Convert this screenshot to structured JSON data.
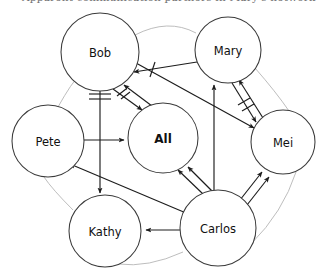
{
  "figure": {
    "type": "node-link-graph",
    "title_fragment": "Apparent communication partners in Mary's network",
    "background_color": "#ffffff",
    "node_fill": "#ffffff",
    "node_stroke": "#3b3b3b",
    "edge_color": "#1c1c1c",
    "ring_color": "#b9b9b9",
    "width": 328,
    "height": 278
  },
  "nodes": [
    {
      "id": "bob",
      "label": "Bob",
      "cx": 100,
      "cy": 52,
      "r": 39,
      "bold": false
    },
    {
      "id": "mary",
      "label": "Mary",
      "cx": 228,
      "cy": 50,
      "r": 33,
      "bold": false
    },
    {
      "id": "pete",
      "label": "Pete",
      "cx": 48,
      "cy": 141,
      "r": 36,
      "bold": false
    },
    {
      "id": "all",
      "label": "All",
      "cx": 163,
      "cy": 138,
      "r": 35,
      "bold": true
    },
    {
      "id": "mei",
      "label": "Mei",
      "cx": 283,
      "cy": 142,
      "r": 32,
      "bold": false
    },
    {
      "id": "kathy",
      "label": "Kathy",
      "cx": 105,
      "cy": 231,
      "r": 36,
      "bold": false
    },
    {
      "id": "carlos",
      "label": "Carlos",
      "cx": 218,
      "cy": 228,
      "r": 38,
      "bold": false
    }
  ],
  "edges": [
    {
      "id": "bob-all-out",
      "from": "bob",
      "to": "all",
      "directed": true,
      "ticks": 2,
      "tick_style": "slash"
    },
    {
      "id": "all-bob-in",
      "from": "all",
      "to": "bob",
      "directed": true,
      "ticks": 0,
      "tick_style": "none"
    },
    {
      "id": "bob-kathy",
      "from": "bob",
      "to": "kathy",
      "directed": true,
      "ticks": 2,
      "tick_style": "bar"
    },
    {
      "id": "pete-all",
      "from": "pete",
      "to": "all",
      "directed": true,
      "ticks": 0,
      "tick_style": "none"
    },
    {
      "id": "bob-mei",
      "from": "bob",
      "to": "mei",
      "directed": true,
      "ticks": 1,
      "tick_style": "slash"
    },
    {
      "id": "mary-bob",
      "from": "mary",
      "to": "bob",
      "directed": true,
      "ticks": 0,
      "tick_style": "none"
    },
    {
      "id": "mary-mei-out",
      "from": "mary",
      "to": "mei",
      "directed": true,
      "ticks": 2,
      "tick_style": "slash"
    },
    {
      "id": "mei-mary-in",
      "from": "mei",
      "to": "mary",
      "directed": true,
      "ticks": 0,
      "tick_style": "none"
    },
    {
      "id": "carlos-mary",
      "from": "carlos",
      "to": "mary",
      "directed": true,
      "ticks": 0,
      "tick_style": "none"
    },
    {
      "id": "carlos-all-a",
      "from": "carlos",
      "to": "all",
      "directed": true,
      "ticks": 0,
      "tick_style": "none"
    },
    {
      "id": "carlos-all-b",
      "from": "carlos",
      "to": "all",
      "directed": true,
      "ticks": 0,
      "tick_style": "none"
    },
    {
      "id": "carlos-pete",
      "from": "carlos",
      "to": "pete",
      "directed": true,
      "ticks": 0,
      "tick_style": "none"
    },
    {
      "id": "carlos-kathy",
      "from": "carlos",
      "to": "kathy",
      "directed": true,
      "ticks": 0,
      "tick_style": "none"
    },
    {
      "id": "carlos-mei-a",
      "from": "carlos",
      "to": "mei",
      "directed": true,
      "ticks": 0,
      "tick_style": "none"
    },
    {
      "id": "carlos-mei-b",
      "from": "carlos",
      "to": "mei",
      "directed": true,
      "ticks": 0,
      "tick_style": "none"
    }
  ],
  "ring": {
    "description": "faint gray ring connecting the six perimeter nodes",
    "order": [
      "bob",
      "mary",
      "mei",
      "carlos",
      "kathy",
      "pete"
    ]
  }
}
